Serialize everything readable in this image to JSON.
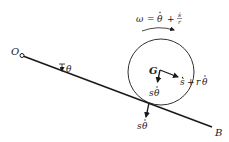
{
  "diagram": {
    "type": "rigid-body-kinematics",
    "labels": {
      "pivot": "O",
      "bar_end": "B",
      "center": "G",
      "theta": "θ",
      "omega_lhs": "ω",
      "omega_eq": "=",
      "omega_theta_dot": "θ",
      "omega_plus": "+",
      "omega_frac_num": "ṡ",
      "omega_frac_den": "r",
      "g_velocity_along": "ṡ + rθ̇",
      "g_velocity_along_s": "ṡ",
      "g_velocity_along_plus": "+",
      "g_velocity_along_r": "r",
      "g_velocity_along_theta": "θ",
      "g_velocity_normal_s": "s",
      "g_velocity_normal_theta": "θ",
      "contact_velocity_s": "s",
      "contact_velocity_theta": "θ"
    },
    "colors": {
      "ink": "#1a1a1a",
      "background": "#ffffff"
    }
  }
}
